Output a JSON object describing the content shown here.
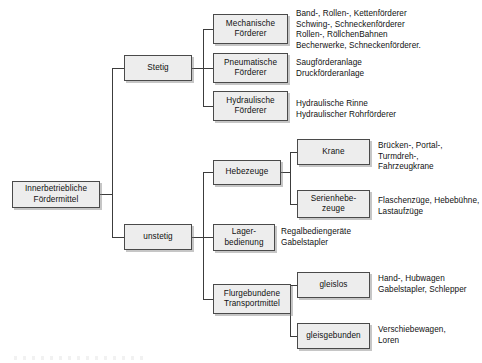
{
  "diagram": {
    "title": "Innerbetriebliche Fördermittel",
    "type": "tree",
    "nodes": {
      "root": {
        "label": "Innerbetriebliche\nFördermittel"
      },
      "stetig": {
        "label": "Stetig"
      },
      "unstetig": {
        "label": "unstetig"
      },
      "mechanische": {
        "label": "Mechanische\nFörderer"
      },
      "pneumatische": {
        "label": "Pneumatische\nFörderer"
      },
      "hydraulische": {
        "label": "Hydraulische\nFörderer"
      },
      "hebezeuge": {
        "label": "Hebezeuge"
      },
      "lagerbedienung": {
        "label": "Lager-\nbedienung"
      },
      "flurgebundene": {
        "label": "Flurgebundene\nTransportmittel"
      },
      "krane": {
        "label": "Krane"
      },
      "serienhebezeuge": {
        "label": "Serienhebe-\nzeuge"
      },
      "gleislos": {
        "label": "gleislos"
      },
      "gleisgebunden": {
        "label": "gleisgebunden"
      }
    },
    "notes": {
      "mechanische": "Band-, Rollen-, Kettenförderer\nSchwing-, Schneckenförderer\nRollen-, RöllchenBahnen\nBecherwerke, Schneckenförderer.",
      "pneumatische": "Saugförderanlage\nDruckförderanlage",
      "hydraulische": "Hydraulische Rinne\nHydraulischer Rohrförderer",
      "krane": "Brücken-, Portal-, Turmdreh-,\nFahrzeugkrane",
      "serienhebezeuge": "Flaschenzüge, Hebebühne,\nLastaufzüge",
      "lagerbedienung": "Regalbediengeräte\nGabelstapler",
      "gleislos": "Hand-, Hubwagen\nGabelstapler, Schlepper",
      "gleisgebunden": "Verschiebewagen,\nLoren"
    },
    "colors": {
      "box_fill": "#ededed",
      "box_border": "#4a4a4a",
      "line": "#3c3c3c",
      "text": "#101010",
      "background": "#ffffff"
    }
  }
}
